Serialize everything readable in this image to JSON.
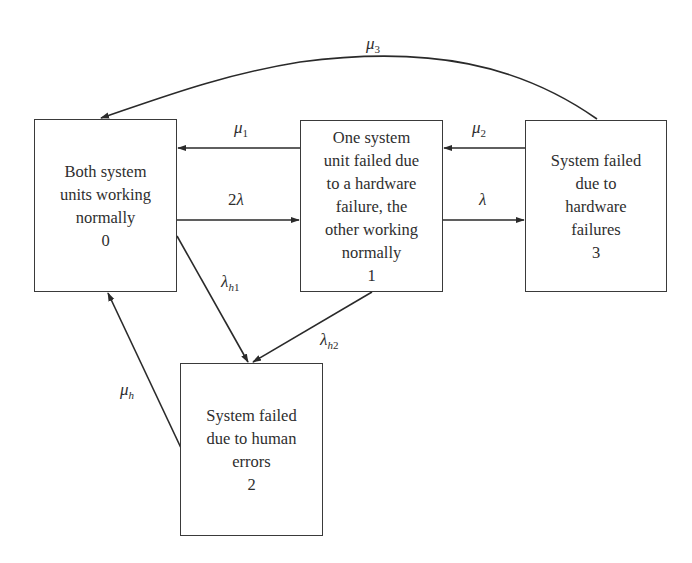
{
  "diagram": {
    "type": "markov-state-transition",
    "states": [
      {
        "id": "0",
        "lines": [
          "Both system",
          "units working",
          "normally",
          "0"
        ]
      },
      {
        "id": "1",
        "lines": [
          "One system",
          "unit failed due",
          "to a hardware",
          "failure, the",
          "other working",
          "normally",
          "1"
        ]
      },
      {
        "id": "2",
        "lines": [
          "System failed",
          "due to human",
          "errors",
          "2"
        ]
      },
      {
        "id": "3",
        "lines": [
          "System failed",
          "due to",
          "hardware",
          "failures",
          "3"
        ]
      }
    ],
    "transitions": [
      {
        "from": "0",
        "to": "1",
        "label_coef": "2",
        "label_sym": "λ",
        "label_sub": ""
      },
      {
        "from": "1",
        "to": "0",
        "label_coef": "",
        "label_sym": "μ",
        "label_sub": "1"
      },
      {
        "from": "1",
        "to": "3",
        "label_coef": "",
        "label_sym": "λ",
        "label_sub": ""
      },
      {
        "from": "3",
        "to": "1",
        "label_coef": "",
        "label_sym": "μ",
        "label_sub": "2"
      },
      {
        "from": "3",
        "to": "0",
        "label_coef": "",
        "label_sym": "μ",
        "label_sub": "3"
      },
      {
        "from": "0",
        "to": "2",
        "label_coef": "",
        "label_sym": "λ",
        "label_sub_i": "h",
        "label_sub": "1"
      },
      {
        "from": "1",
        "to": "2",
        "label_coef": "",
        "label_sym": "λ",
        "label_sub_i": "h",
        "label_sub": "2"
      },
      {
        "from": "2",
        "to": "0",
        "label_coef": "",
        "label_sym": "μ",
        "label_sub_i": "h",
        "label_sub": ""
      }
    ]
  },
  "colors": {
    "line": "#2a2a2a",
    "border": "#3a3a3a",
    "background": "#ffffff"
  }
}
